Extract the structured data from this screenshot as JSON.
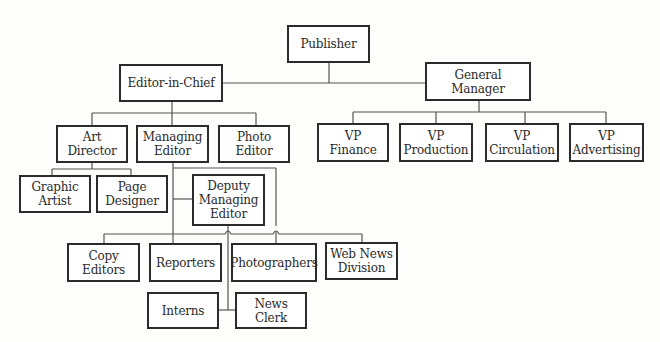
{
  "chart": {
    "type": "org-chart",
    "colors": {
      "line": "#555555",
      "border": "#2b2b2b",
      "text": "#2a2a2a",
      "background": "#fdfdfb"
    },
    "nodes": {
      "publisher": {
        "label": "Publisher"
      },
      "editor_in_chief": {
        "label": "Editor-in-Chief"
      },
      "general_manager": {
        "label": "General Manager"
      },
      "art_director": {
        "label": "Art\nDirector"
      },
      "managing_editor": {
        "label": "Managing\nEditor"
      },
      "photo_editor": {
        "label": "Photo\nEditor"
      },
      "vp_finance": {
        "label": "VP\nFinance"
      },
      "vp_production": {
        "label": "VP\nProduction"
      },
      "vp_circulation": {
        "label": "VP\nCirculation"
      },
      "vp_advertising": {
        "label": "VP\nAdvertising"
      },
      "graphic_artist": {
        "label": "Graphic\nArtist"
      },
      "page_designer": {
        "label": "Page\nDesigner"
      },
      "deputy_managing_editor": {
        "label": "Deputy\nManaging\nEditor"
      },
      "copy_editors": {
        "label": "Copy\nEditors"
      },
      "reporters": {
        "label": "Reporters"
      },
      "photographers": {
        "label": "Photographers"
      },
      "web_news_division": {
        "label": "Web News\nDivision"
      },
      "interns": {
        "label": "Interns"
      },
      "news_clerk": {
        "label": "News\nClerk"
      }
    },
    "edges": [
      [
        "Publisher",
        "Editor-in-Chief"
      ],
      [
        "Publisher",
        "General Manager"
      ],
      [
        "Editor-in-Chief",
        "Art Director"
      ],
      [
        "Editor-in-Chief",
        "Managing Editor"
      ],
      [
        "Editor-in-Chief",
        "Photo Editor"
      ],
      [
        "General Manager",
        "VP Finance"
      ],
      [
        "General Manager",
        "VP Production"
      ],
      [
        "General Manager",
        "VP Circulation"
      ],
      [
        "General Manager",
        "VP Advertising"
      ],
      [
        "Art Director",
        "Graphic Artist"
      ],
      [
        "Art Director",
        "Page Designer"
      ],
      [
        "Managing Editor",
        "Deputy Managing Editor"
      ],
      [
        "Managing Editor",
        "Reporters"
      ],
      [
        "Managing Editor",
        "Photographers"
      ],
      [
        "Deputy Managing Editor",
        "Copy Editors"
      ],
      [
        "Deputy Managing Editor",
        "Web News Division"
      ],
      [
        "Deputy Managing Editor",
        "Interns"
      ],
      [
        "Deputy Managing Editor",
        "News Clerk"
      ]
    ]
  }
}
